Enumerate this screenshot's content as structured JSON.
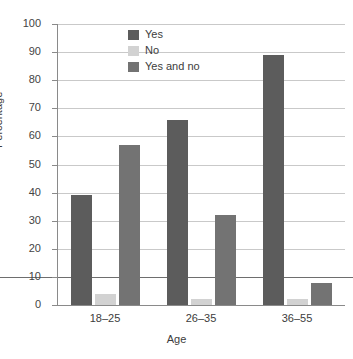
{
  "chart_data": {
    "type": "bar",
    "title": "",
    "xlabel": "Age",
    "ylabel": "Percentage",
    "categories": [
      "18–25",
      "26–35",
      "36–55"
    ],
    "series": [
      {
        "name": "Yes",
        "color": "#5c5c5c",
        "values": [
          39,
          66,
          89
        ]
      },
      {
        "name": "No",
        "color": "#d2d2d2",
        "values": [
          4,
          2,
          2
        ]
      },
      {
        "name": "Yes and no",
        "color": "#737373",
        "values": [
          57,
          32,
          8
        ]
      }
    ],
    "ylim": [
      0,
      100
    ],
    "ytick_labels": [
      "0",
      "10",
      "20",
      "30",
      "40",
      "50",
      "60",
      "70",
      "80",
      "90",
      "100"
    ],
    "ytick_values": [
      0,
      10,
      20,
      30,
      40,
      50,
      60,
      70,
      80,
      90,
      100
    ],
    "grid": true,
    "grid_axis": "y",
    "legend_position": "top-center"
  },
  "axes": {
    "y_title": "Percentage",
    "x_title": "Age"
  },
  "legend": {
    "items": [
      {
        "label": "Yes"
      },
      {
        "label": "No"
      },
      {
        "label": "Yes and no"
      }
    ]
  }
}
